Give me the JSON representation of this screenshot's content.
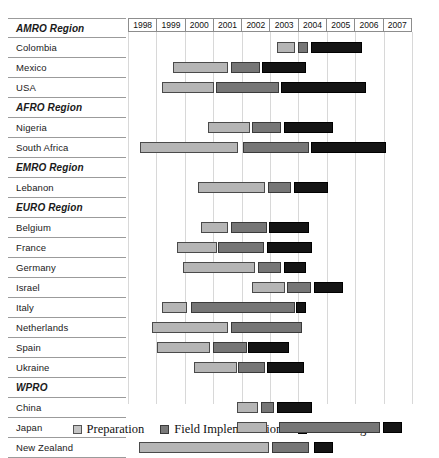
{
  "chart_data": {
    "type": "bar",
    "chart_subtype": "gantt",
    "title": "",
    "xlabel": "",
    "ylabel": "",
    "axis_years": [
      "1998",
      "1999",
      "2000",
      "2001",
      "2002",
      "2003",
      "2004",
      "2005",
      "2006",
      "2007"
    ],
    "xlim": [
      1998,
      2008
    ],
    "grid": true,
    "legend_position": "bottom",
    "phases": [
      {
        "key": "prep",
        "label": "Preparation",
        "color": "#b5b5b5"
      },
      {
        "key": "field",
        "label": "Field Implementation",
        "color": "#767676"
      },
      {
        "key": "proc",
        "label": "Processing",
        "color": "#151515"
      }
    ],
    "rows": [
      {
        "label": "AMRO Region",
        "type": "region",
        "bars": []
      },
      {
        "label": "Colombia",
        "type": "country",
        "bars": [
          {
            "phase": "prep",
            "start": 2002.95,
            "end": 2003.6
          },
          {
            "phase": "field",
            "start": 2003.7,
            "end": 2004.05
          },
          {
            "phase": "proc",
            "start": 2004.15,
            "end": 2005.95
          }
        ]
      },
      {
        "label": "Mexico",
        "type": "country",
        "bars": [
          {
            "phase": "prep",
            "start": 1999.3,
            "end": 2001.25
          },
          {
            "phase": "field",
            "start": 2001.35,
            "end": 2002.35
          },
          {
            "phase": "proc",
            "start": 2002.45,
            "end": 2004.0
          }
        ]
      },
      {
        "label": "USA",
        "type": "country",
        "bars": [
          {
            "phase": "prep",
            "start": 1998.9,
            "end": 2000.75
          },
          {
            "phase": "field",
            "start": 2000.8,
            "end": 2003.05
          },
          {
            "phase": "proc",
            "start": 2003.1,
            "end": 2006.1
          }
        ]
      },
      {
        "label": "AFRO Region",
        "type": "region",
        "bars": []
      },
      {
        "label": "Nigeria",
        "type": "country",
        "bars": [
          {
            "phase": "prep",
            "start": 2000.55,
            "end": 2002.0
          },
          {
            "phase": "field",
            "start": 2002.1,
            "end": 2003.1
          },
          {
            "phase": "proc",
            "start": 2003.2,
            "end": 2004.95
          }
        ]
      },
      {
        "label": "South Africa",
        "type": "country",
        "bars": [
          {
            "phase": "prep",
            "start": 1998.15,
            "end": 2001.6
          },
          {
            "phase": "field",
            "start": 2001.75,
            "end": 2004.1
          },
          {
            "phase": "proc",
            "start": 2004.15,
            "end": 2006.8
          }
        ]
      },
      {
        "label": "EMRO Region",
        "type": "region",
        "bars": []
      },
      {
        "label": "Lebanon",
        "type": "country",
        "bars": [
          {
            "phase": "prep",
            "start": 2000.2,
            "end": 2002.55
          },
          {
            "phase": "field",
            "start": 2002.65,
            "end": 2003.45
          },
          {
            "phase": "proc",
            "start": 2003.55,
            "end": 2004.75
          }
        ]
      },
      {
        "label": "EURO Region",
        "type": "region",
        "bars": []
      },
      {
        "label": "Belgium",
        "type": "country",
        "bars": [
          {
            "phase": "prep",
            "start": 2000.3,
            "end": 2001.25
          },
          {
            "phase": "field",
            "start": 2001.35,
            "end": 2002.6
          },
          {
            "phase": "proc",
            "start": 2002.7,
            "end": 2004.1
          }
        ]
      },
      {
        "label": "France",
        "type": "country",
        "bars": [
          {
            "phase": "prep",
            "start": 1999.45,
            "end": 2000.85
          },
          {
            "phase": "field",
            "start": 2000.9,
            "end": 2002.5
          },
          {
            "phase": "proc",
            "start": 2002.6,
            "end": 2004.2
          }
        ]
      },
      {
        "label": "Germany",
        "type": "country",
        "bars": [
          {
            "phase": "prep",
            "start": 1999.65,
            "end": 2002.2
          },
          {
            "phase": "field",
            "start": 2002.3,
            "end": 2003.1
          },
          {
            "phase": "proc",
            "start": 2003.2,
            "end": 2004.0
          }
        ]
      },
      {
        "label": "Israel",
        "type": "country",
        "bars": [
          {
            "phase": "prep",
            "start": 2002.1,
            "end": 2003.25
          },
          {
            "phase": "field",
            "start": 2003.3,
            "end": 2004.15
          },
          {
            "phase": "proc",
            "start": 2004.25,
            "end": 2005.3
          }
        ]
      },
      {
        "label": "Italy",
        "type": "country",
        "bars": [
          {
            "phase": "prep",
            "start": 1998.9,
            "end": 1999.8
          },
          {
            "phase": "field",
            "start": 1999.95,
            "end": 2003.6
          },
          {
            "phase": "proc",
            "start": 2003.65,
            "end": 2004.0
          }
        ]
      },
      {
        "label": "Netherlands",
        "type": "country",
        "bars": [
          {
            "phase": "prep",
            "start": 1998.55,
            "end": 2001.25
          },
          {
            "phase": "field",
            "start": 2001.35,
            "end": 2003.85
          }
        ]
      },
      {
        "label": "Spain",
        "type": "country",
        "bars": [
          {
            "phase": "prep",
            "start": 1998.75,
            "end": 2000.6
          },
          {
            "phase": "field",
            "start": 2000.7,
            "end": 2001.9
          },
          {
            "phase": "proc",
            "start": 2001.95,
            "end": 2003.4
          }
        ]
      },
      {
        "label": "Ukraine",
        "type": "country",
        "bars": [
          {
            "phase": "prep",
            "start": 2000.05,
            "end": 2001.55
          },
          {
            "phase": "field",
            "start": 2001.6,
            "end": 2002.55
          },
          {
            "phase": "proc",
            "start": 2002.6,
            "end": 2003.9
          }
        ]
      },
      {
        "label": "WPRO",
        "type": "region",
        "bars": []
      },
      {
        "label": "China",
        "type": "country",
        "bars": [
          {
            "phase": "prep",
            "start": 2001.55,
            "end": 2002.3
          },
          {
            "phase": "field",
            "start": 2002.4,
            "end": 2002.85
          },
          {
            "phase": "proc",
            "start": 2002.95,
            "end": 2004.2
          }
        ]
      },
      {
        "label": "Japan",
        "type": "country",
        "bars": [
          {
            "phase": "prep",
            "start": 2001.55,
            "end": 2002.6
          },
          {
            "phase": "field",
            "start": 2003.05,
            "end": 2006.6
          },
          {
            "phase": "proc",
            "start": 2006.7,
            "end": 2007.35
          }
        ]
      },
      {
        "label": "New Zealand",
        "type": "country",
        "bars": [
          {
            "phase": "prep",
            "start": 1998.1,
            "end": 2002.7
          },
          {
            "phase": "field",
            "start": 2002.8,
            "end": 2004.1
          },
          {
            "phase": "proc",
            "start": 2004.25,
            "end": 2004.95
          }
        ]
      }
    ]
  }
}
